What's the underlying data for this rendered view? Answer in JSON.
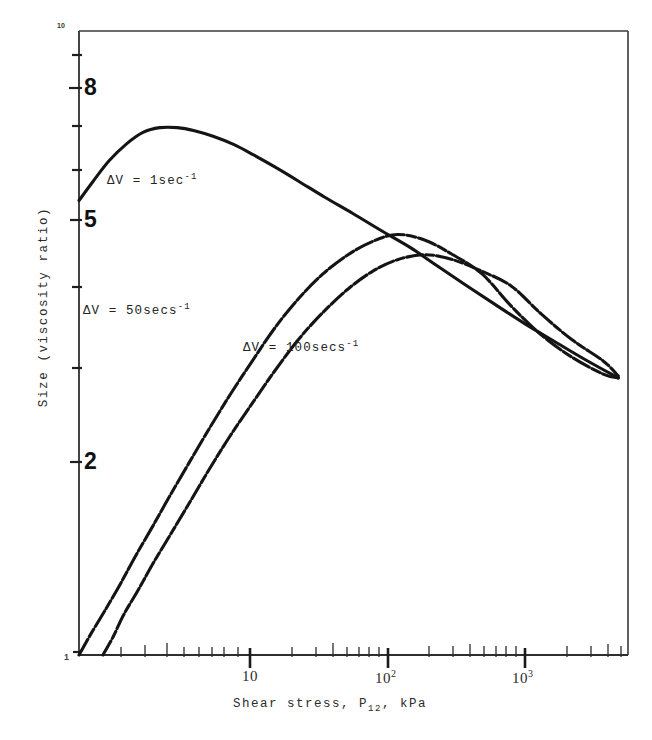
{
  "chart_data": {
    "type": "line",
    "title": "",
    "xlabel": "Shear stress, P12, kPa",
    "ylabel": "Size (viscosity ratio)",
    "xscale": "log",
    "yscale": "log",
    "xlim": [
      1,
      5000
    ],
    "ylim": [
      1,
      10
    ],
    "grid": false,
    "legend_position": "inline-annotations",
    "xtick_labels": [
      "10",
      "10^2",
      "10^3"
    ],
    "xtick_values": [
      10,
      100,
      1000
    ],
    "ytick_labels": [
      "10",
      "8",
      "5",
      "2",
      "1"
    ],
    "ytick_values": [
      10,
      8,
      5,
      2,
      1
    ],
    "yminor_ticks": [
      9,
      8,
      7,
      6,
      5,
      4,
      3,
      2
    ],
    "series": [
      {
        "name": "dV = 1sec-1",
        "label": "ΔV = 1sec",
        "exponent": "-1",
        "x": [
          1.0,
          1.25,
          1.6,
          2.1,
          2.7,
          3.5,
          4.6,
          6.0,
          8.0,
          11,
          15,
          21,
          30,
          45,
          70,
          110,
          170,
          260,
          400,
          620,
          1000,
          1600,
          2600,
          4300
        ],
        "y": [
          5.35,
          5.75,
          6.2,
          6.6,
          6.88,
          7.0,
          7.0,
          6.92,
          6.78,
          6.58,
          6.33,
          6.05,
          5.75,
          5.42,
          5.1,
          4.78,
          4.5,
          4.2,
          3.92,
          3.66,
          3.4,
          3.18,
          2.97,
          2.78
        ]
      },
      {
        "name": "dV = 50secs-1",
        "label": "ΔV = 50secs",
        "exponent": "-1",
        "x": [
          1.0,
          1.2,
          1.5,
          1.9,
          2.4,
          3.1,
          4.1,
          5.5,
          7.5,
          10.5,
          15,
          21,
          30,
          44,
          65,
          95,
          140,
          215,
          330,
          520,
          820,
          1300,
          2100,
          3400,
          4300
        ],
        "y": [
          1.0,
          1.08,
          1.18,
          1.3,
          1.44,
          1.6,
          1.8,
          2.03,
          2.3,
          2.62,
          2.98,
          3.35,
          3.72,
          4.08,
          4.38,
          4.6,
          4.72,
          4.62,
          4.38,
          4.08,
          3.62,
          3.26,
          3.0,
          2.82,
          2.78
        ]
      },
      {
        "name": "dV = 100secs-1",
        "label": "ΔV = 100secs",
        "exponent": "-1",
        "x": [
          1.45,
          1.7,
          2.0,
          2.5,
          3.2,
          4.2,
          5.6,
          7.6,
          10.5,
          15,
          21,
          30,
          44,
          65,
          95,
          140,
          215,
          330,
          520,
          820,
          1300,
          2100,
          3400,
          4300
        ],
        "y": [
          1.0,
          1.07,
          1.16,
          1.27,
          1.41,
          1.57,
          1.76,
          1.99,
          2.25,
          2.55,
          2.86,
          3.2,
          3.54,
          3.86,
          4.12,
          4.3,
          4.38,
          4.3,
          4.12,
          3.9,
          3.52,
          3.2,
          2.96,
          2.8
        ]
      }
    ]
  },
  "labels": {
    "curve1": "ΔV = 1sec",
    "curve1_sup": "-1",
    "curve2": "ΔV = 50secs",
    "curve2_sup": "-1",
    "curve3": "ΔV = 100secs",
    "curve3_sup": "-1"
  },
  "axes": {
    "y_title": "Size (viscosity ratio)",
    "x_title_prefix": "Shear stress, P",
    "x_title_sub": "12",
    "x_title_suffix": ", kPa",
    "y_top_label": "10",
    "y_label_8": "8",
    "y_label_5": "5",
    "y_label_2": "2",
    "y_bottom_label": "1",
    "x_label_10": "10",
    "x_label_100_base": "10",
    "x_label_100_exp": "2",
    "x_label_1000_base": "10",
    "x_label_1000_exp": "3"
  },
  "colors": {
    "ink": "#1a1a1a",
    "curve": "#141414",
    "axis": "#2e2e2e",
    "background": "#ffffff"
  }
}
